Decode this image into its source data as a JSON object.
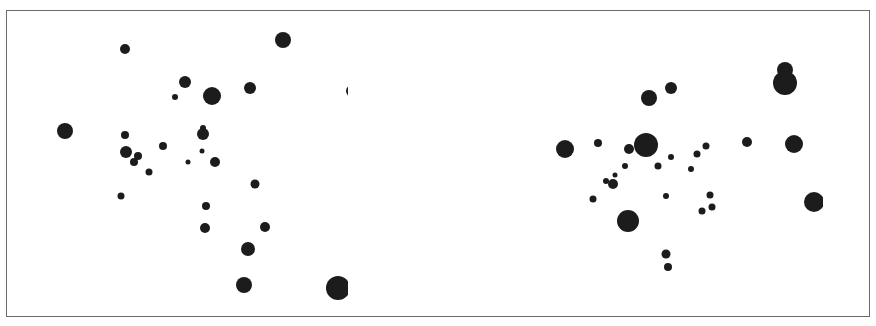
{
  "figure": {
    "frame_color": "#6b6b6b",
    "dot_color": "#1c1c1c"
  },
  "panels": [
    {
      "name": "left-panel",
      "clip": {
        "left": 6,
        "right": 348
      },
      "dots": [
        {
          "x": 125,
          "y": 49,
          "r": 5
        },
        {
          "x": 283,
          "y": 40,
          "r": 8
        },
        {
          "x": 185,
          "y": 82,
          "r": 6
        },
        {
          "x": 212,
          "y": 96,
          "r": 9
        },
        {
          "x": 250,
          "y": 88,
          "r": 6
        },
        {
          "x": 175,
          "y": 97,
          "r": 3
        },
        {
          "x": 352,
          "y": 91,
          "r": 6
        },
        {
          "x": 65,
          "y": 131,
          "r": 8
        },
        {
          "x": 125,
          "y": 135,
          "r": 4
        },
        {
          "x": 203,
          "y": 128,
          "r": 3
        },
        {
          "x": 203,
          "y": 134,
          "r": 6
        },
        {
          "x": 163,
          "y": 146,
          "r": 4
        },
        {
          "x": 126,
          "y": 152,
          "r": 6
        },
        {
          "x": 138,
          "y": 156,
          "r": 4
        },
        {
          "x": 134,
          "y": 162,
          "r": 4
        },
        {
          "x": 202,
          "y": 151,
          "r": 2.5
        },
        {
          "x": 188,
          "y": 162,
          "r": 2.5
        },
        {
          "x": 215,
          "y": 162,
          "r": 5
        },
        {
          "x": 149,
          "y": 172,
          "r": 3.5
        },
        {
          "x": 255,
          "y": 184,
          "r": 4.5
        },
        {
          "x": 121,
          "y": 196,
          "r": 3.5
        },
        {
          "x": 206,
          "y": 206,
          "r": 4
        },
        {
          "x": 205,
          "y": 228,
          "r": 5
        },
        {
          "x": 265,
          "y": 227,
          "r": 5
        },
        {
          "x": 248,
          "y": 249,
          "r": 7
        },
        {
          "x": 244,
          "y": 285,
          "r": 8
        },
        {
          "x": 338,
          "y": 288,
          "r": 12
        }
      ]
    },
    {
      "name": "right-panel",
      "clip": {
        "left": 436,
        "right": 823
      },
      "dots": [
        {
          "x": 785,
          "y": 70,
          "r": 8
        },
        {
          "x": 785,
          "y": 83,
          "r": 12
        },
        {
          "x": 649,
          "y": 98,
          "r": 8
        },
        {
          "x": 671,
          "y": 88,
          "r": 6
        },
        {
          "x": 565,
          "y": 149,
          "r": 9
        },
        {
          "x": 598,
          "y": 143,
          "r": 4
        },
        {
          "x": 629,
          "y": 149,
          "r": 5
        },
        {
          "x": 646,
          "y": 145,
          "r": 12
        },
        {
          "x": 747,
          "y": 142,
          "r": 5
        },
        {
          "x": 794,
          "y": 144,
          "r": 9
        },
        {
          "x": 706,
          "y": 146,
          "r": 3.5
        },
        {
          "x": 671,
          "y": 157,
          "r": 3
        },
        {
          "x": 697,
          "y": 154,
          "r": 3.5
        },
        {
          "x": 625,
          "y": 166,
          "r": 3
        },
        {
          "x": 658,
          "y": 166,
          "r": 3.5
        },
        {
          "x": 691,
          "y": 169,
          "r": 3
        },
        {
          "x": 615,
          "y": 175,
          "r": 2.5
        },
        {
          "x": 606,
          "y": 181,
          "r": 3
        },
        {
          "x": 613,
          "y": 184,
          "r": 5
        },
        {
          "x": 593,
          "y": 199,
          "r": 3.5
        },
        {
          "x": 666,
          "y": 196,
          "r": 3
        },
        {
          "x": 710,
          "y": 195,
          "r": 3.5
        },
        {
          "x": 712,
          "y": 207,
          "r": 3.5
        },
        {
          "x": 702,
          "y": 211,
          "r": 3.5
        },
        {
          "x": 814,
          "y": 202,
          "r": 10
        },
        {
          "x": 628,
          "y": 221,
          "r": 11
        },
        {
          "x": 666,
          "y": 254,
          "r": 4.5
        },
        {
          "x": 668,
          "y": 267,
          "r": 4
        }
      ]
    }
  ]
}
